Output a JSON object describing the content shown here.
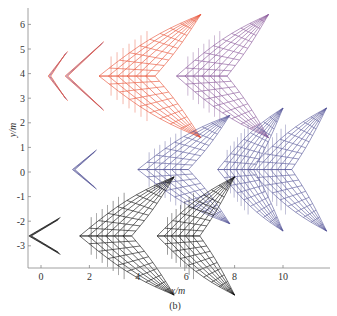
{
  "chart_data": {
    "type": "line",
    "subtype": "trajectory-wireframe-snapshots",
    "title": "",
    "caption": "(b)",
    "xlabel": "x/m",
    "ylabel": "y/m",
    "xlim": [
      -0.5,
      12
    ],
    "ylim": [
      -3.9,
      6.6
    ],
    "xticks": [
      0,
      2,
      4,
      6,
      8,
      10
    ],
    "yticks": [
      -3,
      -2,
      -1,
      0,
      1,
      2,
      3,
      4,
      5,
      6
    ],
    "grid": false,
    "legend": null,
    "series": [
      {
        "name": "formation-red",
        "color": "#e8553a",
        "secondary_color": "#8a5a9a",
        "center_y": 3.9,
        "snapshots": [
          {
            "tip_x": 0.3,
            "back_x": 1.1,
            "half_span": 1.0,
            "solid": false
          },
          {
            "tip_x": 1.0,
            "back_x": 2.6,
            "half_span": 1.4,
            "solid": false
          },
          {
            "tip_x": 2.4,
            "back_x": 6.6,
            "half_span": 2.5,
            "solid": true
          },
          {
            "tip_x": 5.6,
            "back_x": 9.4,
            "half_span": 2.5,
            "solid": true
          }
        ]
      },
      {
        "name": "formation-blue",
        "color": "#5a5a9a",
        "center_y": 0.1,
        "snapshots": [
          {
            "tip_x": 1.3,
            "back_x": 2.3,
            "half_span": 0.8,
            "solid": false
          },
          {
            "tip_x": 4.0,
            "back_x": 7.8,
            "half_span": 2.2,
            "solid": true
          },
          {
            "tip_x": 7.3,
            "back_x": 10.0,
            "half_span": 2.5,
            "solid": true
          },
          {
            "tip_x": 8.6,
            "back_x": 11.8,
            "half_span": 2.5,
            "solid": true
          }
        ]
      },
      {
        "name": "formation-black",
        "color": "#111111",
        "center_y": -2.6,
        "snapshots": [
          {
            "tip_x": -0.5,
            "back_x": 0.8,
            "half_span": 0.75,
            "solid": false
          },
          {
            "tip_x": 1.6,
            "back_x": 5.5,
            "half_span": 2.4,
            "solid": true
          },
          {
            "tip_x": 4.8,
            "back_x": 8.0,
            "half_span": 2.4,
            "solid": true
          }
        ]
      }
    ]
  }
}
